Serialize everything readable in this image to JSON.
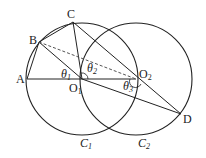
{
  "diagram": {
    "points": {
      "A": {
        "label": "A",
        "x": 27,
        "y": 79
      },
      "B": {
        "label": "B",
        "x": 39,
        "y": 42
      },
      "C": {
        "label": "C",
        "x": 73,
        "y": 22
      },
      "D": {
        "label": "D",
        "x": 181,
        "y": 114
      },
      "O1": {
        "label": "O",
        "sub": "1",
        "x": 82,
        "y": 79
      },
      "O2": {
        "label": "O",
        "sub": "2",
        "x": 136,
        "y": 79
      }
    },
    "circles": [
      {
        "name": "C1",
        "label": "C",
        "sub": "1",
        "cx": 82,
        "cy": 79,
        "r": 56
      },
      {
        "name": "C2",
        "label": "C",
        "sub": "2",
        "cx": 136,
        "cy": 79,
        "r": 56
      }
    ],
    "angles": [
      {
        "label": "θ",
        "sub": "1"
      },
      {
        "label": "θ",
        "sub": "2"
      },
      {
        "label": "θ",
        "sub": "3"
      }
    ],
    "colors": {
      "stroke": "#222222",
      "dashed": "#555555",
      "background": "#ffffff"
    }
  }
}
